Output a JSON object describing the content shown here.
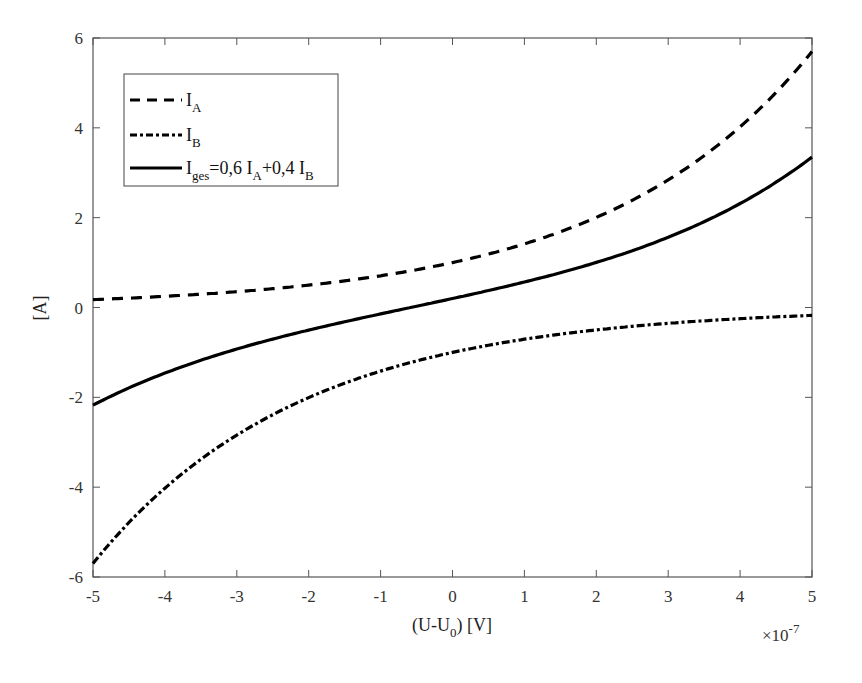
{
  "chart_data": {
    "type": "line",
    "title": "",
    "xlabel": "(U-U0) [V]",
    "xlabel_parts": {
      "pre": "(U-U",
      "sub": "0",
      "post": ") [V]"
    },
    "ylabel": "[A]",
    "x_multiplier": "×10^-7",
    "x_multiplier_parts": {
      "base": "×10",
      "exp": "-7"
    },
    "xlim": [
      -5,
      5
    ],
    "ylim": [
      -6,
      6
    ],
    "xticks": [
      -5,
      -4,
      -3,
      -2,
      -1,
      0,
      1,
      2,
      3,
      4,
      5
    ],
    "yticks": [
      -6,
      -4,
      -2,
      0,
      2,
      4,
      6
    ],
    "grid": false,
    "legend_position": "upper left",
    "x": [
      -5,
      -4,
      -3,
      -2,
      -1,
      0,
      1,
      2,
      3,
      4,
      5
    ],
    "series": [
      {
        "name": "I_A",
        "label_main": "I",
        "label_sub": "A",
        "style": "dashed",
        "values": [
          0.18,
          0.25,
          0.35,
          0.5,
          0.71,
          1.0,
          1.42,
          2.01,
          2.84,
          4.02,
          5.7
        ]
      },
      {
        "name": "I_B",
        "label_main": "I",
        "label_sub": "B",
        "style": "dashdot",
        "values": [
          -5.7,
          -4.02,
          -2.84,
          -2.01,
          -1.42,
          -1.0,
          -0.71,
          -0.5,
          -0.35,
          -0.25,
          -0.18
        ]
      },
      {
        "name": "I_ges=0,6 I_A+0,4 I_B",
        "label_main": "I",
        "label_sub": "ges",
        "label_rest": "=0,6 I",
        "label_sub2": "A",
        "label_rest2": "+0,4 I",
        "label_sub3": "B",
        "style": "solid",
        "values": [
          -2.17,
          -1.46,
          -0.93,
          -0.5,
          -0.14,
          0.2,
          0.57,
          1.01,
          1.56,
          2.31,
          3.35
        ]
      }
    ],
    "curve_model": {
      "k": 0.348,
      "IA": "exp(k*x)",
      "IB": "-exp(-k*x)",
      "Iges": "0.6*IA+0.4*IB"
    },
    "colors": {
      "line": "#000000",
      "axes": "#555555"
    }
  }
}
